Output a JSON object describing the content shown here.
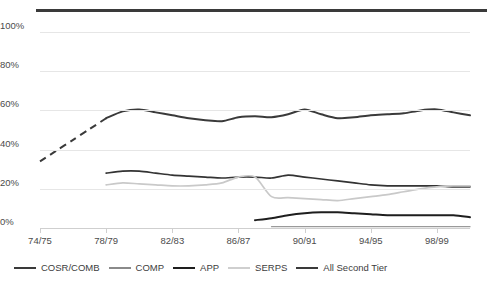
{
  "chart_data": {
    "type": "line",
    "title": "",
    "xlabel": "",
    "ylabel": "",
    "ylim": [
      0,
      100
    ],
    "ytick_labels": [
      "0%",
      "20%",
      "40%",
      "60%",
      "80%",
      "100%"
    ],
    "ytick_values": [
      0,
      20,
      40,
      60,
      80,
      100
    ],
    "grid": true,
    "legend_position": "bottom",
    "x": [
      "74/75",
      "75/76",
      "76/77",
      "77/78",
      "78/79",
      "79/80",
      "80/81",
      "81/82",
      "82/83",
      "83/84",
      "84/85",
      "85/86",
      "86/87",
      "87/88",
      "88/89",
      "89/90",
      "90/91",
      "91/92",
      "92/93",
      "93/94",
      "94/95",
      "95/96",
      "96/97",
      "97/98",
      "98/99",
      "99/00",
      "00/01"
    ],
    "xtick_labels": [
      "74/75",
      "78/79",
      "82/83",
      "86/87",
      "90/91",
      "94/95",
      "98/99"
    ],
    "xtick_indices": [
      0,
      4,
      8,
      12,
      16,
      20,
      24
    ],
    "series": [
      {
        "name": "COSR/COMB",
        "color": "#3a3a3a",
        "width": 2.0,
        "dashed_segment": {
          "from_index": 0,
          "to_index": 4
        },
        "values": [
          34,
          39.5,
          45,
          50.5,
          56,
          59.5,
          60.5,
          59,
          57.5,
          56,
          55,
          54.5,
          56.5,
          57,
          56.5,
          58,
          60.5,
          58,
          56,
          56.5,
          57.5,
          58,
          58.5,
          60,
          60.5,
          59,
          57.5
        ]
      },
      {
        "name": "COMP",
        "color": "#333333",
        "width": 1.7,
        "start_index": 4,
        "values": [
          null,
          null,
          null,
          null,
          28,
          29,
          29,
          28,
          27,
          26.5,
          26,
          25.5,
          26,
          26,
          25.5,
          27,
          26,
          25,
          24,
          23,
          22,
          21.5,
          21.5,
          21.5,
          21.5,
          21,
          21
        ]
      },
      {
        "name": "APP",
        "color": "#1e1e1e",
        "width": 2.0,
        "start_index": 13,
        "values": [
          null,
          null,
          null,
          null,
          null,
          null,
          null,
          null,
          null,
          null,
          null,
          null,
          null,
          4,
          5,
          6.5,
          7.5,
          8,
          8,
          7.5,
          7,
          6.5,
          6.5,
          6.5,
          6.5,
          6.5,
          5.5
        ]
      },
      {
        "name": "SERPS",
        "color": "#c9c9c9",
        "width": 1.7,
        "start_index": 4,
        "values": [
          null,
          null,
          null,
          null,
          22,
          23,
          22.5,
          22,
          21.5,
          21.5,
          22,
          23,
          26,
          26,
          16,
          15.5,
          15,
          14.5,
          14,
          15,
          16,
          17,
          18.5,
          20,
          21,
          21.5,
          21.5
        ]
      },
      {
        "name": "All Second Tier",
        "color": "#9a9a9a",
        "width": 1.3,
        "start_index": 14,
        "values": [
          null,
          null,
          null,
          null,
          null,
          null,
          null,
          null,
          null,
          null,
          null,
          null,
          null,
          null,
          0.7,
          0.7,
          0.7,
          0.7,
          0.7,
          0.7,
          0.7,
          0.7,
          0.7,
          0.7,
          0.7,
          0.7,
          0.7
        ]
      }
    ]
  },
  "legend": {
    "items": [
      {
        "label": "COSR/COMB",
        "color": "#3a3a3a"
      },
      {
        "label": "COMP",
        "color": "#8a8a8a"
      },
      {
        "label": "APP",
        "color": "#1e1e1e"
      },
      {
        "label": "SERPS",
        "color": "#cfcfcf"
      },
      {
        "label": "All Second Tier",
        "color": "#3a3a3a"
      }
    ]
  }
}
